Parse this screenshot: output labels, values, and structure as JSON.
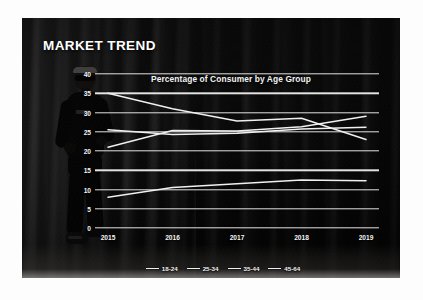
{
  "slide": {
    "title": "MARKET TREND"
  },
  "chart_data": {
    "type": "line",
    "title": "Percentage of Consumer by Age Group",
    "xlabel": "",
    "ylabel": "",
    "categories": [
      "2015",
      "2016",
      "2017",
      "2018",
      "2019"
    ],
    "ylim": [
      0,
      40
    ],
    "yticks": [
      0,
      5,
      10,
      15,
      20,
      25,
      30,
      35,
      40
    ],
    "grid": true,
    "legend_position": "bottom",
    "line_color": "#f0f0f0",
    "series": [
      {
        "name": "18-24",
        "values": [
          8,
          10.5,
          11.5,
          12.5,
          12.3
        ]
      },
      {
        "name": "25-34",
        "values": [
          21,
          25.3,
          25.2,
          26.3,
          29
        ]
      },
      {
        "name": "35-44",
        "values": [
          35,
          31,
          27.8,
          28.5,
          23
        ]
      },
      {
        "name": "45-64",
        "values": [
          25.5,
          24.3,
          24.6,
          25.7,
          26.2
        ]
      }
    ]
  },
  "legend": {
    "items": [
      {
        "label": "18-24"
      },
      {
        "label": "25-34"
      },
      {
        "label": "35-44"
      },
      {
        "label": "45-64"
      }
    ]
  }
}
